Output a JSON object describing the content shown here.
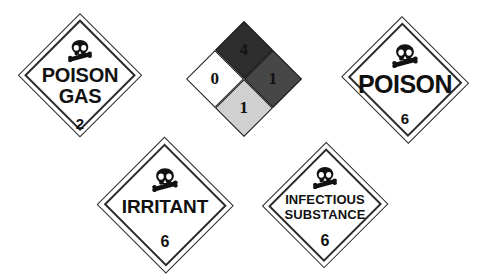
{
  "canvas": {
    "width": 482,
    "height": 278,
    "background_color": "#ffffff",
    "description": "Five hazardous-material warning symbols: four DOT diamond placards and one NFPA 704 fire diamond"
  },
  "placards": [
    {
      "id": "poison-gas",
      "name": "POISON GAS placard",
      "lines": [
        "POISON",
        "GAS"
      ],
      "hazard_class": "2",
      "icon": "skull-and-crossbones-icon",
      "fill_color": "#ffffff",
      "border_color": "#2b2b2b",
      "text_color": "#111111"
    },
    {
      "id": "poison",
      "name": "POISON placard",
      "lines": [
        "POISON"
      ],
      "hazard_class": "6",
      "icon": "skull-and-crossbones-icon",
      "fill_color": "#ffffff",
      "border_color": "#2b2b2b",
      "text_color": "#111111"
    },
    {
      "id": "irritant",
      "name": "IRRITANT placard",
      "lines": [
        "IRRITANT"
      ],
      "hazard_class": "6",
      "icon": "skull-and-crossbones-icon",
      "fill_color": "#ffffff",
      "border_color": "#2b2b2b",
      "text_color": "#111111"
    },
    {
      "id": "infectious-substance",
      "name": "INFECTIOUS SUBSTANCE placard",
      "lines": [
        "INFECTIOUS",
        "SUBSTANCE"
      ],
      "hazard_class": "6",
      "icon": "skull-and-crossbones-icon",
      "fill_color": "#ffffff",
      "border_color": "#2b2b2b",
      "text_color": "#111111"
    }
  ],
  "nfpa_diamond": {
    "name": "NFPA 704 fire diamond",
    "quadrants": {
      "top": {
        "label": "fire-hazard",
        "value": "1",
        "fill_color": "#474747",
        "text_color": "#111111"
      },
      "left": {
        "label": "health-hazard",
        "value": "4",
        "fill_color": "#2e2e2e",
        "text_color": "#151515"
      },
      "right": {
        "label": "reactivity-hazard",
        "value": "1",
        "fill_color": "#d0d0d0",
        "text_color": "#111111"
      },
      "bottom": {
        "label": "specific-hazard",
        "value": "0",
        "fill_color": "#ffffff",
        "text_color": "#111111"
      }
    }
  }
}
